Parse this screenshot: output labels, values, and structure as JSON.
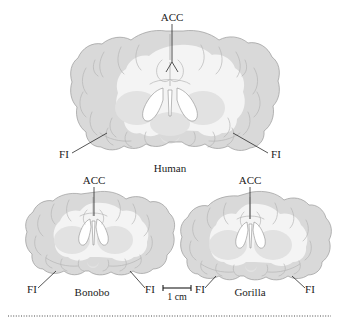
{
  "figure": {
    "type": "anatomical-illustration",
    "panels": [
      {
        "id": "human",
        "species_label": "Human",
        "annotations": [
          {
            "name": "acc",
            "label": "ACC"
          },
          {
            "name": "fi-left",
            "label": "FI"
          },
          {
            "name": "fi-right",
            "label": "FI"
          }
        ]
      },
      {
        "id": "bonobo",
        "species_label": "Bonobo",
        "annotations": [
          {
            "name": "acc",
            "label": "ACC"
          },
          {
            "name": "fi-left",
            "label": "FI"
          },
          {
            "name": "fi-right",
            "label": "FI"
          }
        ]
      },
      {
        "id": "gorilla",
        "species_label": "Gorilla",
        "annotations": [
          {
            "name": "acc",
            "label": "ACC"
          },
          {
            "name": "fi-left",
            "label": "FI"
          },
          {
            "name": "fi-right",
            "label": "FI"
          }
        ]
      }
    ],
    "scale_bar": {
      "label": "1 cm"
    },
    "colors": {
      "cortex": "#d9d9d9",
      "white_matter": "#f4f4f4",
      "deep_gray": "#e2e2e2",
      "ventricle": "#ffffff",
      "outline": "#9a9a9a",
      "text": "#1c1c1c"
    }
  }
}
